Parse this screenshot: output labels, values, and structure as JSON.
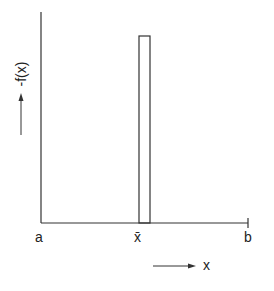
{
  "diagram": {
    "y_axis_label": "-f(x)",
    "x_axis_label": "x",
    "tick_labels": {
      "left": "a",
      "mean": "x̄",
      "right": "b"
    },
    "colors": {
      "line": "#333333",
      "background": "#ffffff"
    }
  }
}
